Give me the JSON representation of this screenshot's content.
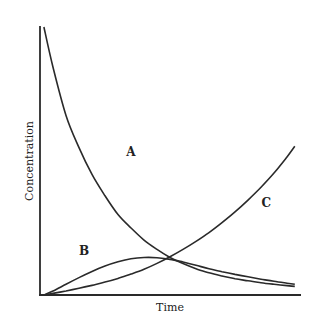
{
  "chart_data": {
    "type": "line",
    "title": "",
    "xlabel": "Time",
    "ylabel": "Concentration",
    "xlim": [
      0,
      10
    ],
    "ylim": [
      0,
      1
    ],
    "grid": false,
    "legend": "none",
    "x": [
      0.15,
      0.5,
      1,
      1.5,
      2,
      2.5,
      3,
      3.5,
      4,
      4.5,
      5,
      5.5,
      6,
      6.5,
      7,
      7.5,
      8,
      8.5,
      9,
      9.5,
      9.8
    ],
    "series": [
      {
        "name": "A",
        "label_at": [
          3.5,
          0.52
        ],
        "values": [
          1.0,
          0.85,
          0.67,
          0.55,
          0.45,
          0.37,
          0.3,
          0.25,
          0.205,
          0.17,
          0.14,
          0.117,
          0.098,
          0.083,
          0.071,
          0.061,
          0.053,
          0.046,
          0.04,
          0.035,
          0.032
        ]
      },
      {
        "name": "B",
        "label_at": [
          1.7,
          0.15
        ],
        "values": [
          0.0,
          0.015,
          0.04,
          0.065,
          0.088,
          0.108,
          0.124,
          0.135,
          0.14,
          0.139,
          0.133,
          0.123,
          0.111,
          0.098,
          0.087,
          0.077,
          0.068,
          0.059,
          0.051,
          0.044,
          0.04
        ]
      },
      {
        "name": "C",
        "label_at": [
          8.7,
          0.33
        ],
        "values": [
          0.0,
          0.006,
          0.015,
          0.025,
          0.036,
          0.048,
          0.062,
          0.078,
          0.096,
          0.118,
          0.143,
          0.17,
          0.2,
          0.233,
          0.27,
          0.31,
          0.354,
          0.402,
          0.455,
          0.515,
          0.555
        ]
      }
    ]
  }
}
